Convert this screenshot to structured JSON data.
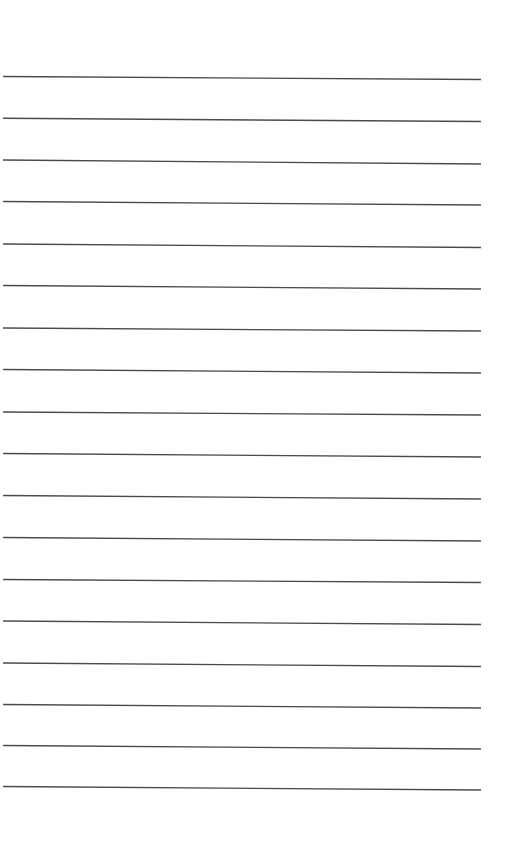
{
  "page": {
    "type": "lined-paper",
    "background": "#ffffff",
    "line_color": "#4a4a4a",
    "line_count": 18
  },
  "lines": [
    {
      "y_left": 76.5,
      "y_right": 79.5
    },
    {
      "y_left": 118.3,
      "y_right": 121.5
    },
    {
      "y_left": 160,
      "y_right": 164
    },
    {
      "y_left": 201.5,
      "y_right": 205
    },
    {
      "y_left": 244,
      "y_right": 247.5
    },
    {
      "y_left": 285.5,
      "y_right": 289
    },
    {
      "y_left": 328,
      "y_right": 331
    },
    {
      "y_left": 369.5,
      "y_right": 373
    },
    {
      "y_left": 412,
      "y_right": 415
    },
    {
      "y_left": 453.5,
      "y_right": 457
    },
    {
      "y_left": 495.5,
      "y_right": 499
    },
    {
      "y_left": 537.5,
      "y_right": 541
    },
    {
      "y_left": 579.5,
      "y_right": 582.5
    },
    {
      "y_left": 621,
      "y_right": 624.5
    },
    {
      "y_left": 663,
      "y_right": 666.5
    },
    {
      "y_left": 704.5,
      "y_right": 708
    },
    {
      "y_left": 745.5,
      "y_right": 749
    },
    {
      "y_left": 786.5,
      "y_right": 790
    }
  ],
  "geometry": {
    "x_start": 3,
    "x_end": 481
  }
}
